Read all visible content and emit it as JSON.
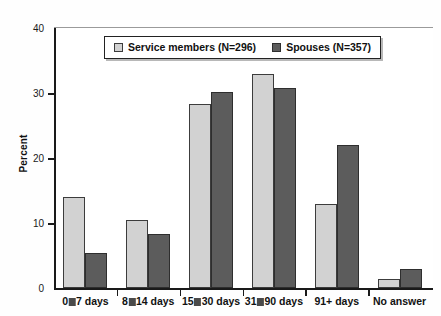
{
  "chart_data": {
    "type": "bar",
    "title": "",
    "xlabel": "",
    "ylabel": "Percent",
    "ylim": [
      0,
      40
    ],
    "yticks": [
      0,
      10,
      20,
      30,
      40
    ],
    "grid": false,
    "legend_position": "top-center",
    "categories": [
      "0□7 days",
      "8□14 days",
      "15□30 days",
      "31□90 days",
      "91+ days",
      "No answer"
    ],
    "series": [
      {
        "name": "Service members (N=296)",
        "color": "#d2d2d2",
        "values": [
          14.0,
          10.4,
          28.3,
          33.0,
          12.9,
          1.4
        ]
      },
      {
        "name": "Spouses (N=357)",
        "color": "#5c5c5c",
        "values": [
          5.4,
          8.3,
          30.2,
          30.8,
          22.0,
          3.0
        ]
      }
    ]
  },
  "axis": {
    "y_title": "Percent",
    "y_tick_labels": [
      "0",
      "10",
      "20",
      "30",
      "40"
    ],
    "x_tick_labels": [
      "0□7 days",
      "8□14 days",
      "15□30 days",
      "31□90 days",
      "91+ days",
      "No answer"
    ]
  },
  "legend": {
    "entries": [
      {
        "label": "Service members (N=296)",
        "swatch": "light"
      },
      {
        "label": "Spouses (N=357)",
        "swatch": "dark"
      }
    ]
  },
  "colors": {
    "series_light": "#d2d2d2",
    "series_dark": "#5c5c5c",
    "axis": "#1a1a1a",
    "background": "#ffffff"
  }
}
